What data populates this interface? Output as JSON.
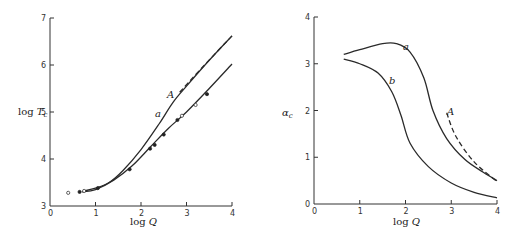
{
  "chart_data": [
    {
      "type": "line",
      "title": "",
      "xlabel": "log Q",
      "ylabel": "log T_c",
      "xlim": [
        0,
        4
      ],
      "ylim": [
        3,
        7
      ],
      "xticks": [
        "0",
        "1",
        "2",
        "3",
        "4"
      ],
      "yticks": [
        "3",
        "4",
        "5",
        "6",
        "7"
      ],
      "grid": false,
      "series": [
        {
          "name": "a",
          "style": "solid",
          "x": [
            0.75,
            1.0,
            1.3,
            1.6,
            2.0,
            2.4,
            2.7,
            3.0,
            3.5,
            4.0
          ],
          "y": [
            3.32,
            3.38,
            3.5,
            3.75,
            4.2,
            4.75,
            5.2,
            5.55,
            6.1,
            6.62
          ]
        },
        {
          "name": "lower",
          "style": "solid",
          "x": [
            0.7,
            1.0,
            1.4,
            1.8,
            2.2,
            2.6,
            3.0,
            3.5,
            4.0
          ],
          "y": [
            3.3,
            3.35,
            3.55,
            3.85,
            4.25,
            4.65,
            5.0,
            5.5,
            6.02
          ]
        },
        {
          "name": "A",
          "style": "dashed",
          "x": [
            2.85,
            3.3,
            4.0
          ],
          "y": [
            5.42,
            5.9,
            6.62
          ]
        }
      ],
      "markers": {
        "x": [
          0.4,
          0.65,
          0.75,
          1.05,
          1.75,
          2.2,
          2.3,
          2.5,
          2.8,
          2.9,
          3.2,
          3.45
        ],
        "y": [
          3.28,
          3.3,
          3.32,
          3.38,
          3.78,
          4.22,
          4.3,
          4.52,
          4.83,
          4.92,
          5.15,
          5.38
        ]
      },
      "annotations": [
        {
          "text": "a",
          "x": 2.35,
          "y": 5.0
        },
        {
          "text": "A",
          "x": 2.7,
          "y": 5.42
        }
      ]
    },
    {
      "type": "line",
      "title": "",
      "xlabel": "log Q",
      "ylabel": "α_c",
      "xlim": [
        0,
        4
      ],
      "ylim": [
        0,
        4
      ],
      "xticks": [
        "0",
        "1",
        "2",
        "3",
        "4"
      ],
      "yticks": [
        "0",
        "1",
        "2",
        "3",
        "4"
      ],
      "grid": false,
      "series": [
        {
          "name": "a",
          "style": "solid",
          "x": [
            0.65,
            1.0,
            1.5,
            1.8,
            2.1,
            2.4,
            2.6,
            2.9,
            3.3,
            3.7,
            4.0
          ],
          "y": [
            3.2,
            3.3,
            3.43,
            3.43,
            3.25,
            2.7,
            2.0,
            1.4,
            0.95,
            0.68,
            0.5
          ]
        },
        {
          "name": "b",
          "style": "solid",
          "x": [
            0.65,
            1.0,
            1.4,
            1.7,
            1.9,
            2.1,
            2.5,
            3.0,
            3.5,
            4.0
          ],
          "y": [
            3.1,
            3.0,
            2.8,
            2.4,
            1.9,
            1.3,
            0.8,
            0.45,
            0.25,
            0.13
          ]
        },
        {
          "name": "A",
          "style": "dashed",
          "x": [
            2.9,
            3.1,
            3.5,
            4.0
          ],
          "y": [
            1.95,
            1.45,
            0.9,
            0.48
          ]
        }
      ],
      "annotations": [
        {
          "text": "a",
          "x": 2.1,
          "y": 3.35
        },
        {
          "text": "b",
          "x": 1.7,
          "y": 2.7
        },
        {
          "text": "A",
          "x": 2.95,
          "y": 2.0
        }
      ]
    }
  ],
  "labels": {
    "left_ylabel_main": "log ",
    "left_ylabel_var": "T",
    "left_ylabel_sub": "c",
    "xlabel_main": "log ",
    "xlabel_var": "Q",
    "right_ylabel_var": "α",
    "right_ylabel_sub": "c",
    "curve_a": "a",
    "curve_b": "b",
    "curve_A": "A",
    "ticks_left_x": [
      "0",
      "1",
      "2",
      "3",
      "4"
    ],
    "ticks_left_y": [
      "3",
      "4",
      "5",
      "6",
      "7"
    ],
    "ticks_right_x": [
      "0",
      "1",
      "2",
      "3",
      "4"
    ],
    "ticks_right_y": [
      "0",
      "1",
      "2",
      "3",
      "4"
    ]
  }
}
